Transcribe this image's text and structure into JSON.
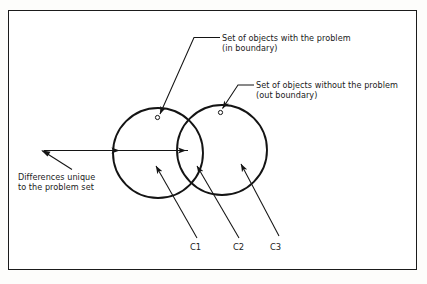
{
  "figure": {
    "type": "venn-diagram",
    "frame": {
      "visible": true,
      "color": "#1b1b1b"
    },
    "background": "#ffffff"
  },
  "annotations": {
    "in_boundary": {
      "line1": "Set of objects with the problem",
      "line2": "(in boundary)",
      "target": "left-circle-boundary-marker"
    },
    "out_boundary": {
      "line1": "Set of objects without the problem",
      "line2": "(out boundary)",
      "target": "right-circle-boundary-marker"
    },
    "differences": {
      "line1": "Differences unique",
      "line2": "to the problem set",
      "target": "double-headed-span-arrow"
    }
  },
  "region_labels": [
    {
      "id": "c1",
      "text": "C1",
      "region": "left-circle-only"
    },
    {
      "id": "c2",
      "text": "C2",
      "region": "intersection"
    },
    {
      "id": "c3",
      "text": "C3",
      "region": "right-circle-only"
    }
  ],
  "geometry": {
    "left_circle": {
      "cx": 158,
      "cy": 153,
      "r": 45
    },
    "right_circle": {
      "cx": 222,
      "cy": 150,
      "r": 45
    },
    "span_arrow": {
      "x1": 117,
      "x2": 188,
      "y": 150
    }
  },
  "colors": {
    "stroke": "#141414",
    "frame": "#1b1b1b",
    "text": "#1a1a1a",
    "paper": "#ffffff"
  }
}
